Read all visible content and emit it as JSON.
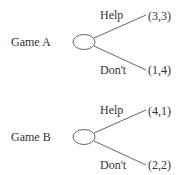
{
  "games": [
    {
      "label": "Game A",
      "branches": [
        {
          "action": "Help",
          "payoff": "(3,3)"
        },
        {
          "action": "Don't",
          "payoff": "(1,4)"
        }
      ]
    },
    {
      "label": "Game B",
      "branches": [
        {
          "action": "Help",
          "payoff": "(4,1)"
        },
        {
          "action": "Don't",
          "payoff": "(2,2)"
        }
      ]
    }
  ]
}
